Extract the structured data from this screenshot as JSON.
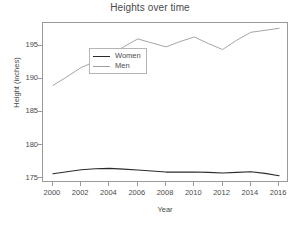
{
  "chart_data": {
    "type": "line",
    "title": "Heights over time",
    "xlabel": "Year",
    "ylabel": "Height (inches)",
    "x": [
      2000,
      2001,
      2002,
      2003,
      2004,
      2005,
      2006,
      2007,
      2008,
      2009,
      2010,
      2011,
      2012,
      2013,
      2014,
      2015,
      2016
    ],
    "xticks": [
      "2000",
      "2002",
      "2004",
      "2006",
      "2008",
      "2010",
      "2012",
      "2014",
      "2016"
    ],
    "xtick_values": [
      2000,
      2002,
      2004,
      2006,
      2008,
      2010,
      2012,
      2014,
      2016
    ],
    "yticks": [
      "175",
      "180",
      "185",
      "190",
      "195"
    ],
    "ytick_values": [
      175,
      180,
      185,
      190,
      195
    ],
    "xlim": [
      1999.3,
      2016.7
    ],
    "ylim": [
      174.3,
      198.4
    ],
    "grid": false,
    "legend_position": "upper left",
    "series": [
      {
        "name": "Women",
        "color": "#2b2b2b",
        "values": [
          175.7,
          176.0,
          176.3,
          176.45,
          176.5,
          176.4,
          176.25,
          176.1,
          175.95,
          175.95,
          175.95,
          175.9,
          175.8,
          175.9,
          176.0,
          175.75,
          175.4
        ]
      },
      {
        "name": "Men",
        "color": "#a0a0a0",
        "values": [
          189.0,
          190.3,
          191.7,
          192.6,
          193.5,
          194.8,
          196.0,
          195.4,
          194.8,
          195.6,
          196.3,
          195.3,
          194.4,
          195.8,
          197.0,
          197.3,
          197.6
        ]
      }
    ]
  },
  "legend": {
    "items": [
      {
        "label": "Women",
        "color": "#2b2b2b"
      },
      {
        "label": "Men",
        "color": "#a0a0a0"
      }
    ]
  }
}
